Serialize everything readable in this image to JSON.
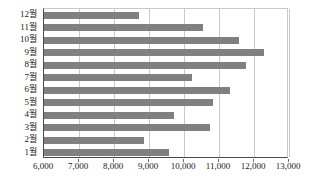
{
  "chart_data": {
    "type": "bar",
    "orientation": "horizontal",
    "title": "",
    "xlabel": "",
    "ylabel": "",
    "categories": [
      "1월",
      "2월",
      "3월",
      "4월",
      "5월",
      "6월",
      "7월",
      "8월",
      "9월",
      "10월",
      "11월",
      "12월"
    ],
    "values": [
      9570,
      8860,
      10740,
      9710,
      10830,
      11320,
      10230,
      11770,
      12290,
      11570,
      10540,
      8700
    ],
    "xlim": [
      6000,
      13000
    ],
    "xticks": [
      6000,
      7000,
      8000,
      9000,
      10000,
      11000,
      12000,
      13000
    ],
    "xtick_labels": [
      "6,000",
      "7,000",
      "8,000",
      "9,000",
      "10,000",
      "11,000",
      "12,000",
      "13,000"
    ],
    "grid": "vertical",
    "legend": "none",
    "bar_color": "#808080",
    "axis_color": "#4a4a4a",
    "gridline_color": "#c9c9c9",
    "display_order": [
      "12월",
      "11월",
      "10월",
      "9월",
      "8월",
      "7월",
      "6월",
      "5월",
      "4월",
      "3월",
      "2월",
      "1월"
    ]
  }
}
